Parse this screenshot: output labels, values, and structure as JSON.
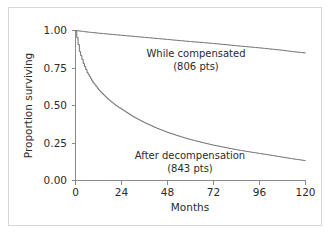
{
  "chart_data": {
    "type": "line",
    "title": "",
    "subtitle": "",
    "xlabel": "Months",
    "ylabel": "Proportion surviving",
    "xlim": [
      0,
      120
    ],
    "ylim": [
      0,
      1
    ],
    "xticks": [
      "0",
      "24",
      "48",
      "72",
      "96",
      "120"
    ],
    "xtick_values": [
      0,
      24,
      48,
      72,
      96,
      120
    ],
    "yticks": [
      "0.00",
      "0.25",
      "0.50",
      "0.75",
      "1.00"
    ],
    "ytick_values": [
      0,
      0.25,
      0.5,
      0.75,
      1
    ],
    "grid": false,
    "legend_position": "inline-annotations",
    "curve_color": "#6e6e6e",
    "axis_color": "#8a8a8a",
    "series": [
      {
        "name": "While compensated",
        "annotation_line1": "While compensated",
        "annotation_line2": "(806 pts)",
        "patients": 806,
        "x": [
          0,
          3,
          6,
          9,
          12,
          18,
          24,
          30,
          36,
          42,
          48,
          54,
          60,
          66,
          72,
          78,
          84,
          90,
          96,
          102,
          108,
          114,
          120
        ],
        "values": [
          1.0,
          0.995,
          0.99,
          0.986,
          0.982,
          0.975,
          0.968,
          0.961,
          0.954,
          0.947,
          0.94,
          0.933,
          0.926,
          0.92,
          0.913,
          0.906,
          0.898,
          0.891,
          0.884,
          0.876,
          0.868,
          0.858,
          0.85
        ]
      },
      {
        "name": "After decompensation",
        "annotation_line1": "After decompensation",
        "annotation_line2": "(843 pts)",
        "patients": 843,
        "x": [
          0,
          2,
          4,
          6,
          9,
          12,
          15,
          18,
          21,
          24,
          30,
          36,
          42,
          48,
          54,
          60,
          66,
          72,
          78,
          84,
          90,
          96,
          102,
          108,
          114,
          120
        ],
        "values": [
          1.0,
          0.86,
          0.78,
          0.72,
          0.655,
          0.605,
          0.565,
          0.53,
          0.5,
          0.475,
          0.425,
          0.385,
          0.35,
          0.32,
          0.295,
          0.272,
          0.253,
          0.235,
          0.22,
          0.205,
          0.192,
          0.18,
          0.168,
          0.155,
          0.143,
          0.132
        ]
      }
    ]
  }
}
